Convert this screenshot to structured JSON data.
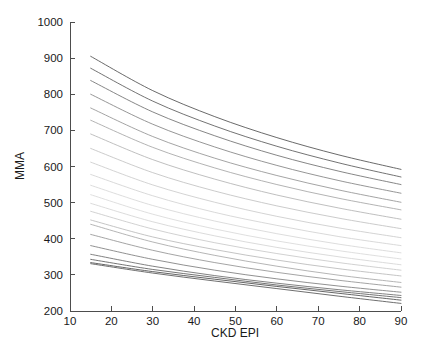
{
  "chart_data": {
    "type": "line",
    "title": "",
    "subtitle": "",
    "xlabel": "CKD EPI",
    "ylabel": "MMA",
    "xlim": [
      10,
      90
    ],
    "ylim": [
      200,
      1000
    ],
    "xticks": [
      10,
      20,
      30,
      40,
      50,
      60,
      70,
      80,
      90
    ],
    "xticklabels": [
      "10",
      "20",
      "30",
      "40",
      "50",
      "60",
      "70",
      "80",
      "90"
    ],
    "yticks": [
      200,
      300,
      400,
      500,
      600,
      700,
      800,
      900,
      1000
    ],
    "yticklabels": [
      "200",
      "300",
      "400",
      "500",
      "600",
      "700",
      "800",
      "900",
      "1000"
    ],
    "grid": false,
    "legend": false,
    "legend_position": "none",
    "x_data_range": [
      15,
      90
    ],
    "annotations": [],
    "series": [
      {
        "name": "curve-01",
        "color": "#4f4f4f",
        "x": [
          15,
          30,
          45,
          60,
          75,
          90
        ],
        "values": [
          905,
          810,
          738,
          680,
          632,
          592
        ]
      },
      {
        "name": "curve-02",
        "color": "#5a5a5a",
        "x": [
          15,
          30,
          45,
          60,
          75,
          90
        ],
        "values": [
          872,
          781,
          712,
          656,
          610,
          571
        ]
      },
      {
        "name": "curve-03",
        "color": "#707070",
        "x": [
          15,
          30,
          45,
          60,
          75,
          90
        ],
        "values": [
          838,
          751,
          685,
          631,
          587,
          550
        ]
      },
      {
        "name": "curve-04",
        "color": "#838383",
        "x": [
          15,
          30,
          45,
          60,
          75,
          90
        ],
        "values": [
          800,
          717,
          654,
          603,
          561,
          526
        ]
      },
      {
        "name": "curve-05",
        "color": "#949494",
        "x": [
          15,
          30,
          45,
          60,
          75,
          90
        ],
        "values": [
          762,
          683,
          623,
          575,
          535,
          501
        ]
      },
      {
        "name": "curve-06",
        "color": "#a5a5a5",
        "x": [
          15,
          30,
          45,
          60,
          75,
          90
        ],
        "values": [
          728,
          653,
          596,
          550,
          512,
          480
        ]
      },
      {
        "name": "curve-07",
        "color": "#b4b4b4",
        "x": [
          15,
          30,
          45,
          60,
          75,
          90
        ],
        "values": [
          690,
          619,
          565,
          521,
          485,
          454
        ]
      },
      {
        "name": "curve-08",
        "color": "#c2c2c2",
        "x": [
          15,
          30,
          45,
          60,
          75,
          90
        ],
        "values": [
          650,
          583,
          532,
          491,
          457,
          428
        ]
      },
      {
        "name": "curve-09",
        "color": "#cbcbcb",
        "x": [
          15,
          30,
          45,
          60,
          75,
          90
        ],
        "values": [
          612,
          549,
          501,
          462,
          430,
          403
        ]
      },
      {
        "name": "curve-10",
        "color": "#d2d2d2",
        "x": [
          15,
          30,
          45,
          60,
          75,
          90
        ],
        "values": [
          578,
          519,
          473,
          437,
          406,
          381
        ]
      },
      {
        "name": "curve-11",
        "color": "#d7d7d7",
        "x": [
          15,
          30,
          45,
          60,
          75,
          90
        ],
        "values": [
          548,
          492,
          449,
          414,
          385,
          361
        ]
      },
      {
        "name": "curve-12",
        "color": "#d9d9d9",
        "x": [
          15,
          30,
          45,
          60,
          75,
          90
        ],
        "values": [
          522,
          468,
          427,
          394,
          367,
          344
        ]
      },
      {
        "name": "curve-13",
        "color": "#d4d4d4",
        "x": [
          15,
          30,
          45,
          60,
          75,
          90
        ],
        "values": [
          498,
          447,
          408,
          376,
          350,
          328
        ]
      },
      {
        "name": "curve-14",
        "color": "#c9c9c9",
        "x": [
          15,
          30,
          45,
          60,
          75,
          90
        ],
        "values": [
          476,
          427,
          389,
          359,
          334,
          313
        ]
      },
      {
        "name": "curve-15",
        "color": "#b9b9b9",
        "x": [
          15,
          30,
          45,
          60,
          75,
          90
        ],
        "values": [
          452,
          405,
          370,
          341,
          317,
          297
        ]
      },
      {
        "name": "curve-16",
        "color": "#a8a8a8",
        "x": [
          15,
          30,
          45,
          60,
          75,
          90
        ],
        "values": [
          440,
          391,
          354,
          324,
          299,
          279
        ]
      },
      {
        "name": "curve-17",
        "color": "#949494",
        "x": [
          15,
          30,
          45,
          60,
          75,
          90
        ],
        "values": [
          412,
          368,
          334,
          307,
          285,
          266
        ]
      },
      {
        "name": "curve-18",
        "color": "#7d7d7d",
        "x": [
          15,
          30,
          45,
          60,
          75,
          90
        ],
        "values": [
          381,
          343,
          313,
          289,
          269,
          252
        ]
      },
      {
        "name": "curve-19",
        "color": "#6b6b6b",
        "x": [
          15,
          30,
          45,
          60,
          75,
          90
        ],
        "values": [
          357,
          324,
          298,
          277,
          259,
          243
        ]
      },
      {
        "name": "curve-20",
        "color": "#5c5c5c",
        "x": [
          15,
          30,
          45,
          60,
          75,
          90
        ],
        "values": [
          343,
          315,
          293,
          272,
          254,
          237
        ]
      },
      {
        "name": "curve-21",
        "color": "#4a4a4a",
        "x": [
          15,
          30,
          45,
          60,
          75,
          90
        ],
        "values": [
          334,
          309,
          288,
          268,
          249,
          230
        ]
      },
      {
        "name": "curve-22",
        "color": "#555555",
        "x": [
          15,
          30,
          45,
          60,
          75,
          90
        ],
        "values": [
          331,
          305,
          283,
          262,
          241,
          221
        ]
      }
    ]
  },
  "axes": {
    "x_title": "CKD EPI",
    "y_title": "MMA"
  }
}
